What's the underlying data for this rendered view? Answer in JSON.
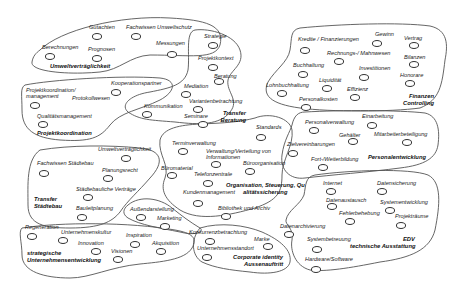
{
  "diagram": {
    "clusters": [
      {
        "id": "umwelt",
        "title": "Umweltverträglichkeit",
        "items": [
          "Gutachten",
          "Fachwissen Umweltschutz",
          "Berechnungen",
          "Prognosen",
          "Messungen"
        ]
      },
      {
        "id": "projekt",
        "title": "Projektkoordination",
        "items": [
          "Kooperationspartner",
          "Projektkoordination/ management",
          "Protokollwesen",
          "Qualitätsmanagement"
        ]
      },
      {
        "id": "beratung",
        "title": "Transfer Beratung",
        "items": [
          "Strategie",
          "Projektkontext",
          "Beratung",
          "Mediation",
          "Variantenbetrachtung",
          "Kommunikation",
          "Seminare"
        ]
      },
      {
        "id": "finanzen",
        "title": "Finanzen Controlling",
        "items": [
          "Kredite / Finanzierungen",
          "Gewinn",
          "Vertrag",
          "Rechnungs-/ Mahnwesen",
          "Bilanzen",
          "Buchhaltung",
          "Investitionen",
          "Honorare",
          "Lohnbuchhaltung",
          "Liquidität",
          "Effizienz",
          "Personalkosten"
        ]
      },
      {
        "id": "personal",
        "title": "Personalentwicklung",
        "items": [
          "Personalverwaltung",
          "Einarbeitung",
          "Gehälter",
          "Mitarbeiterbeteiligung",
          "Zielvereinbarungen",
          "Fort-/Weiterbildung"
        ]
      },
      {
        "id": "organisation",
        "title": "Organisation, Steuerung, Qualitätssicherung",
        "title_line1": "Organisation, Steuerung, Qu",
        "title_line2": "alitätssicherung",
        "items": [
          "Standards",
          "Terminverwaltung",
          "Verwaltung/Verteilung von",
          "Informationen",
          "Büroorganisation",
          "Büromaterial",
          "Telefonzentrale",
          "Kundenmanagement",
          "Bibliothek und Archiv"
        ]
      },
      {
        "id": "staedtebau",
        "title": "Transfer Städtebau",
        "title_line1": "Transfer",
        "title_line2": "Städtebau",
        "items": [
          "Umweltverträglichkeit",
          "Fachwissen Städtebau",
          "Planungsrecht",
          "Städtebauliche Verträge",
          "Bauleitplanung"
        ]
      },
      {
        "id": "marketing",
        "title": "",
        "items": [
          "Außendarstellung",
          "Marketing"
        ]
      },
      {
        "id": "strategie",
        "title": "strategische Unternehmensentwicklung",
        "title_line1": "strategische",
        "title_line2": "Unternehmensentwicklung",
        "items": [
          "Regeneration",
          "Unternehmenskultur",
          "Inspiration",
          "Innovation",
          "Akquisition",
          "Visionen"
        ]
      },
      {
        "id": "corporate",
        "title": "Corporate identity Aussenauftritt",
        "title_line1": "Corporate identity",
        "title_line2": "Aussenauftritt",
        "items": [
          "Konkurrenzbetrachtung",
          "Marke",
          "Unternehmensstandort"
        ]
      },
      {
        "id": "edv",
        "title": "EDV technische Ausstattung",
        "title_line1": "EDV",
        "title_line2": "technische Ausstattung",
        "items": [
          "Internet",
          "Datensicherung",
          "Datenaustausch",
          "Systementwicklung",
          "Fehlerbehebung",
          "Projekträume",
          "Datenarchivierung",
          "Systembetreuung",
          "Hardware/Software"
        ]
      }
    ]
  }
}
